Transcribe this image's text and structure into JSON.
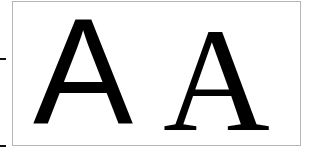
{
  "figure": {
    "glyphs": [
      {
        "label": "A",
        "style": "sans-serif"
      },
      {
        "label": "A",
        "style": "serif"
      }
    ],
    "colors": {
      "text": "#000000",
      "frame": "#b5b5b5",
      "background": "#ffffff"
    }
  }
}
